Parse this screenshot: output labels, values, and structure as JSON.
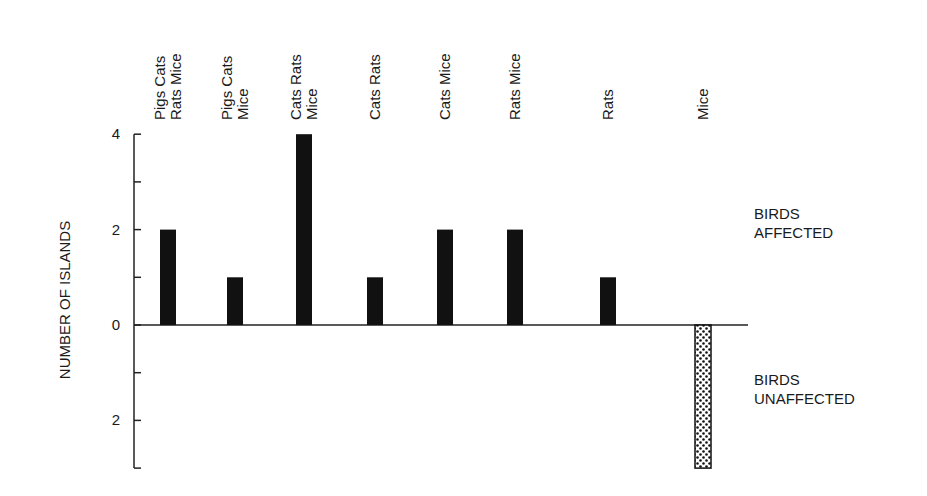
{
  "chart_data": {
    "type": "bar",
    "title": "",
    "xlabel": "",
    "ylabel": "NUMBER OF ISLANDS",
    "categories": [
      [
        "Pigs Cats",
        "Rats Mice"
      ],
      [
        "Pigs Cats",
        "Mice"
      ],
      [
        "Cats Rats",
        "Mice"
      ],
      [
        "Cats Rats"
      ],
      [
        "Cats Mice"
      ],
      [
        "Rats Mice"
      ],
      [
        "Rats"
      ],
      [
        "Mice"
      ]
    ],
    "series": [
      {
        "name": "Birds affected",
        "values": [
          2,
          1,
          4,
          1,
          2,
          2,
          1,
          0
        ],
        "fill": "solid",
        "color": "#111111"
      },
      {
        "name": "Birds unaffected",
        "values": [
          0,
          0,
          0,
          0,
          0,
          0,
          0,
          3
        ],
        "fill": "stippled",
        "color": "#111111"
      }
    ],
    "ylim": [
      -3,
      4
    ],
    "y_ticks": [
      {
        "value": 4,
        "label": "4"
      },
      {
        "value": 3,
        "label": ""
      },
      {
        "value": 2,
        "label": "2"
      },
      {
        "value": 1,
        "label": ""
      },
      {
        "value": 0,
        "label": "0"
      },
      {
        "value": -1,
        "label": ""
      },
      {
        "value": -2,
        "label": "2"
      },
      {
        "value": -3,
        "label": ""
      }
    ],
    "annotations": {
      "upper": [
        "BIRDS",
        "AFFECTED"
      ],
      "lower": [
        "BIRDS",
        "UNAFFECTED"
      ]
    },
    "grid": false,
    "legend": "none"
  }
}
